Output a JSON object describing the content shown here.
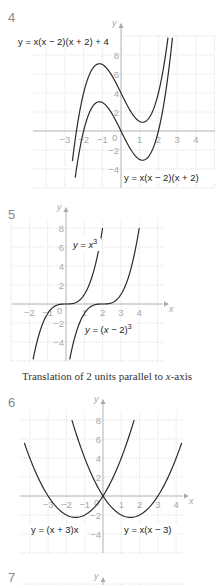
{
  "problems": [
    {
      "number": "4"
    },
    {
      "number": "5",
      "caption": "Translation of 2 units parallel to x-axis"
    },
    {
      "number": "6"
    },
    {
      "number": "7"
    }
  ],
  "axis_labels": {
    "x": "x",
    "y": "y"
  },
  "chart_data": [
    {
      "type": "line",
      "problem": "4",
      "title": "",
      "xlabel": "x",
      "ylabel": "y",
      "xlim": [
        -4.5,
        5
      ],
      "ylim": [
        -6,
        10
      ],
      "grid": true,
      "x_ticks": [
        "-3",
        "-2",
        "-1",
        "0",
        "1",
        "2",
        "3",
        "4"
      ],
      "y_ticks": [
        "8",
        "6",
        "4",
        "2",
        "-2",
        "-4"
      ],
      "series": [
        {
          "name": "y = x(x − 2)(x + 2) + 4",
          "expression": "x^3 - 4x + 4",
          "x_range": [
            -2.6,
            2.6
          ],
          "key_points": [
            {
              "x": -1.15,
              "y": 7.08,
              "label": "local max"
            },
            {
              "x": 1.15,
              "y": 0.92,
              "label": "local min"
            }
          ]
        },
        {
          "name": "y = x(x − 2)(x + 2)",
          "expression": "x^3 - 4x",
          "x_range": [
            -2.45,
            2.75
          ],
          "key_points": [
            {
              "x": -2,
              "y": 0
            },
            {
              "x": 0,
              "y": 0
            },
            {
              "x": 2,
              "y": 0
            },
            {
              "x": -1.15,
              "y": 3.08
            },
            {
              "x": 1.15,
              "y": -3.08
            }
          ]
        }
      ]
    },
    {
      "type": "line",
      "problem": "5",
      "title": "Translation of 2 units parallel to x-axis",
      "xlabel": "x",
      "ylabel": "y",
      "xlim": [
        -3,
        5.3
      ],
      "ylim": [
        -6,
        9
      ],
      "grid": true,
      "x_ticks": [
        "-2",
        "-1",
        "0",
        "1",
        "2",
        "3",
        "4"
      ],
      "y_ticks": [
        "8",
        "6",
        "4",
        "2",
        "-2",
        "-4"
      ],
      "series": [
        {
          "name": "y = x³",
          "expression": "x^3",
          "x_range": [
            -1.8,
            2
          ]
        },
        {
          "name": "y = (x − 2)³",
          "expression": "(x-2)^3",
          "x_range": [
            0.2,
            4
          ]
        }
      ]
    },
    {
      "type": "line",
      "problem": "6",
      "title": "",
      "xlabel": "x",
      "ylabel": "y",
      "xlim": [
        -4.5,
        4.4
      ],
      "ylim": [
        -6,
        9
      ],
      "grid": true,
      "x_ticks": [
        "-3",
        "-2",
        "-1",
        "0",
        "1",
        "2",
        "3",
        "4"
      ],
      "y_ticks": [
        "8",
        "6",
        "4",
        "2",
        "-2",
        "-4"
      ],
      "series": [
        {
          "name": "y = (x + 3)x",
          "expression": "x^2 + 3x",
          "x_range": [
            -4.3,
            1.7
          ],
          "key_points": [
            {
              "x": -3,
              "y": 0
            },
            {
              "x": 0,
              "y": 0
            },
            {
              "x": -1.5,
              "y": -2.25
            }
          ]
        },
        {
          "name": "y = x(x − 3)",
          "expression": "x^2 - 3x",
          "x_range": [
            -1.7,
            4.3
          ],
          "key_points": [
            {
              "x": 0,
              "y": 0
            },
            {
              "x": 3,
              "y": 0
            },
            {
              "x": 1.5,
              "y": -2.25
            }
          ]
        }
      ]
    }
  ]
}
